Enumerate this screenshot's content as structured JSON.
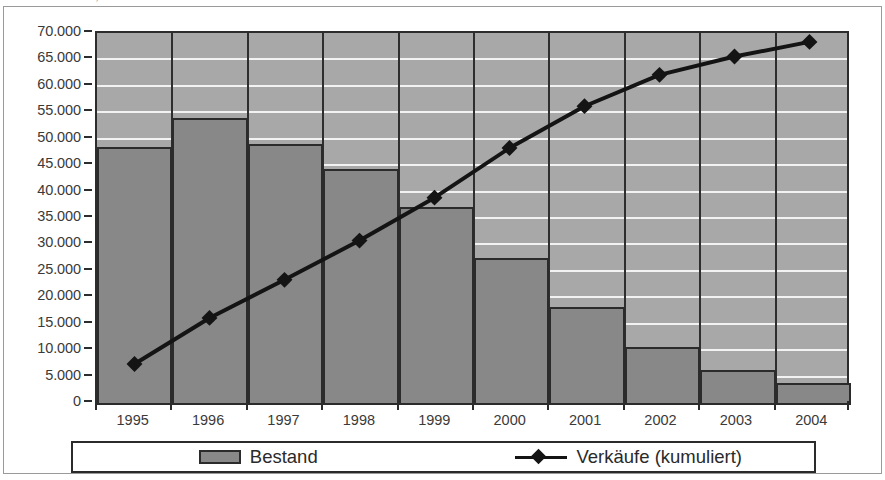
{
  "caption": {
    "text": "Abb. 17:  Bestand, Neubau und Verkäufe kumuliert"
  },
  "chart": {
    "plot": {
      "background_color": "#a8a8a8",
      "gridline_color": "#f2f2f2",
      "border_color": "#2c2c2c"
    }
  },
  "chart_data": {
    "type": "bar",
    "title": "",
    "subtitle": "",
    "xlabel": "",
    "ylabel": "",
    "ylim": [
      0,
      70000
    ],
    "ytick_step": 5000,
    "grid": true,
    "legend_position": "bottom",
    "categories": [
      "1995",
      "1996",
      "1997",
      "1998",
      "1999",
      "2000",
      "2001",
      "2002",
      "2003",
      "2004"
    ],
    "ytick_labels": [
      "70.000",
      "65.000",
      "60.000",
      "55.000",
      "50.000",
      "45.000",
      "40.000",
      "35.000",
      "30.000",
      "25.000",
      "20.000",
      "15.000",
      "10.000",
      "5.000",
      "0"
    ],
    "ytick_values": [
      70000,
      65000,
      60000,
      55000,
      50000,
      45000,
      40000,
      35000,
      30000,
      25000,
      20000,
      15000,
      10000,
      5000,
      0
    ],
    "series": [
      {
        "name": "Bestand",
        "type": "bar",
        "color": "#888888",
        "border_color": "#2b2b2b",
        "values": [
          48500,
          54000,
          49000,
          44300,
          37000,
          27500,
          18200,
          10600,
          6200,
          3700
        ]
      },
      {
        "name": "Verkäufe (kumuliert)",
        "type": "line",
        "color": "#141414",
        "marker": "diamond",
        "values": [
          6700,
          15500,
          22800,
          30300,
          38500,
          48000,
          56000,
          62000,
          65500,
          68300
        ]
      }
    ]
  },
  "legend": {
    "entries": [
      {
        "label": "Bestand",
        "swatch": "bar-swatch"
      },
      {
        "label": "Verkäufe (kumuliert)",
        "swatch": "line-diamond-swatch"
      }
    ]
  }
}
